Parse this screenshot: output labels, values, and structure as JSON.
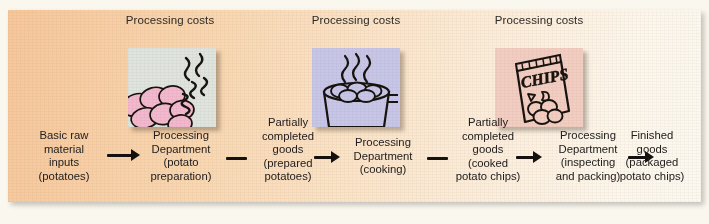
{
  "diagram": {
    "panel_background_left": "#f6c79a",
    "panel_background_right": "#fbf8f0",
    "arrow_color": "#15110e",
    "text_color": "#232020"
  },
  "cost_labels": [
    {
      "line1": "Processing",
      "line2": "costs"
    },
    {
      "line1": "Processing",
      "line2": "costs"
    },
    {
      "line1": "Processing",
      "line2": "costs"
    }
  ],
  "thumbnails": [
    {
      "name": "potato-preparation-thumbnail",
      "alt": "Peeled pink potatoes with steam swirls",
      "background": "#dfe4de",
      "accent": "#f2b8ce"
    },
    {
      "name": "cooking-pot-thumbnail",
      "alt": "Cooking pot with potatoes and rising steam",
      "background": "#c7c6e8",
      "accent": "#c7c6e8"
    },
    {
      "name": "chips-bag-thumbnail",
      "alt": "Bag of potato chips labelled CHIPS",
      "background": "#f2cdc2",
      "accent": "#f2cdc2",
      "bag_text": "CHIPS"
    }
  ],
  "flow": {
    "nodes": [
      {
        "name": "basic-raw-material-inputs",
        "lines": [
          "Basic raw",
          "material",
          "inputs",
          "(potatoes)"
        ]
      },
      {
        "name": "processing-department-potato-preparation",
        "lines": [
          "Processing",
          "Department",
          "(potato",
          "preparation)"
        ]
      },
      {
        "name": "partially-completed-goods-prepared-potatoes",
        "lines": [
          "Partially",
          "completed",
          "goods",
          "(prepared",
          "potatoes)"
        ]
      },
      {
        "name": "processing-department-cooking",
        "lines": [
          "Processing",
          "Department",
          "(cooking)"
        ]
      },
      {
        "name": "partially-completed-goods-cooked-potato-chips",
        "lines": [
          "Partially",
          "completed",
          "goods",
          "(cooked",
          "potato chips)"
        ]
      },
      {
        "name": "processing-department-inspecting-and-packing",
        "lines": [
          "Processing",
          "Department",
          "(inspecting",
          "and packing)"
        ]
      },
      {
        "name": "finished-goods-packaged-potato-chips",
        "lines": [
          "Finished",
          "goods",
          "(packaged",
          "potato chips)"
        ]
      }
    ],
    "connectors": [
      {
        "name": "arrow-inputs-to-prep",
        "kind": "arrow"
      },
      {
        "name": "dash-prep-to-wip1",
        "kind": "dash"
      },
      {
        "name": "arrow-wip1-to-cooking",
        "kind": "arrow"
      },
      {
        "name": "dash-cooking-to-wip2",
        "kind": "dash"
      },
      {
        "name": "arrow-wip2-to-packing",
        "kind": "arrow"
      },
      {
        "name": "arrow-packing-to-finished",
        "kind": "arrow"
      }
    ]
  }
}
